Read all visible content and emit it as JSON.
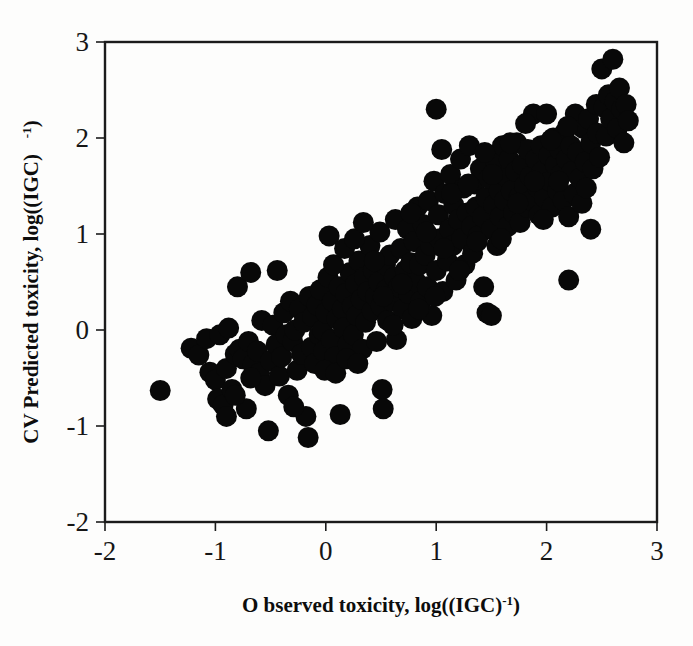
{
  "figure": {
    "name": "cv-predicted-vs-observed-toxicity-scatter",
    "background_color": "#fdfdfc",
    "marker_color": "#080808",
    "axis_color": "#1b1b1b"
  },
  "chart_data": {
    "type": "scatter",
    "title": "",
    "subtitle": "",
    "xlabel": "Observed toxicity, log((IGC)-1)",
    "xlabel_main": "O bserved toxicity, log((IGC)",
    "xlabel_sup": "-1",
    "xlabel_tail": ")",
    "ylabel": "CV Predicted toxicity, log((IGC)  -1)",
    "ylabel_main": "CV Predicted toxicity, log((IGC)",
    "ylabel_sup": "-1",
    "ylabel_tail": ")",
    "xlim": [
      -2,
      3
    ],
    "ylim": [
      -2,
      3
    ],
    "xticks": [
      -2,
      -1,
      0,
      1,
      2,
      3
    ],
    "yticks": [
      -2,
      -1,
      0,
      1,
      2,
      3
    ],
    "xtick_labels": [
      "-2",
      "-1",
      "0",
      "1",
      "2",
      "3"
    ],
    "ytick_labels": [
      "-2",
      "-1",
      "0",
      "1",
      "2",
      "3"
    ],
    "grid": false,
    "legend": false,
    "legend_position": "none",
    "marker_shape": "circle",
    "marker_diameter_px": 21,
    "n_points": 248,
    "series": [
      {
        "name": "compounds",
        "points": [
          [
            -1.5,
            -0.63
          ],
          [
            -1.22,
            -0.19
          ],
          [
            -1.15,
            -0.26
          ],
          [
            -1.08,
            -0.09
          ],
          [
            -1.05,
            -0.44
          ],
          [
            -1.0,
            -0.52
          ],
          [
            -0.98,
            -0.72
          ],
          [
            -0.96,
            -0.05
          ],
          [
            -0.93,
            -0.78
          ],
          [
            -0.9,
            -0.4
          ],
          [
            -0.88,
            0.02
          ],
          [
            -0.85,
            -0.62
          ],
          [
            -0.82,
            -0.25
          ],
          [
            -0.8,
            0.45
          ],
          [
            -0.78,
            -0.2
          ],
          [
            -0.75,
            -0.3
          ],
          [
            -0.72,
            -0.82
          ],
          [
            -0.7,
            -0.12
          ],
          [
            -0.68,
            0.6
          ],
          [
            -0.66,
            -0.36
          ],
          [
            -0.62,
            -0.22
          ],
          [
            -0.6,
            -0.45
          ],
          [
            -0.58,
            0.1
          ],
          [
            -0.55,
            -0.58
          ],
          [
            -0.52,
            -1.05
          ],
          [
            -0.5,
            -0.32
          ],
          [
            -0.48,
            0.05
          ],
          [
            -0.45,
            -0.15
          ],
          [
            -0.44,
            0.62
          ],
          [
            -0.42,
            -0.48
          ],
          [
            -0.4,
            -0.28
          ],
          [
            -0.38,
            0.18
          ],
          [
            -0.36,
            -0.05
          ],
          [
            -0.34,
            -0.68
          ],
          [
            -0.32,
            0.3
          ],
          [
            -0.3,
            -0.12
          ],
          [
            -0.28,
            0.0
          ],
          [
            -0.26,
            -0.42
          ],
          [
            -0.24,
            0.22
          ],
          [
            -0.22,
            -0.25
          ],
          [
            -0.2,
            0.08
          ],
          [
            -0.18,
            -0.9
          ],
          [
            -0.16,
            -1.12
          ],
          [
            -0.15,
            0.35
          ],
          [
            -0.13,
            -0.18
          ],
          [
            -0.12,
            0.14
          ],
          [
            -0.1,
            -0.35
          ],
          [
            -0.08,
            0.26
          ],
          [
            -0.06,
            -0.05
          ],
          [
            -0.05,
            0.42
          ],
          [
            -0.03,
            0.0
          ],
          [
            -0.02,
            -0.22
          ],
          [
            0.0,
            0.18
          ],
          [
            0.02,
            0.55
          ],
          [
            0.03,
            0.98
          ],
          [
            0.05,
            -0.1
          ],
          [
            0.06,
            0.3
          ],
          [
            0.08,
            -0.28
          ],
          [
            0.1,
            0.12
          ],
          [
            0.12,
            0.45
          ],
          [
            0.13,
            -0.88
          ],
          [
            0.15,
            0.22
          ],
          [
            0.16,
            0.02
          ],
          [
            0.18,
            0.38
          ],
          [
            0.2,
            -0.15
          ],
          [
            0.22,
            0.6
          ],
          [
            0.24,
            0.25
          ],
          [
            0.25,
            -0.05
          ],
          [
            0.27,
            0.48
          ],
          [
            0.28,
            0.15
          ],
          [
            0.3,
            0.72
          ],
          [
            0.32,
            0.32
          ],
          [
            0.33,
            -0.2
          ],
          [
            0.35,
            0.55
          ],
          [
            0.36,
            0.08
          ],
          [
            0.38,
            0.4
          ],
          [
            0.4,
            0.88
          ],
          [
            0.42,
            0.2
          ],
          [
            0.43,
            0.62
          ],
          [
            0.45,
            0.35
          ],
          [
            0.46,
            -0.12
          ],
          [
            0.48,
            0.5
          ],
          [
            0.49,
            1.02
          ],
          [
            0.5,
            0.25
          ],
          [
            0.51,
            -0.62
          ],
          [
            0.52,
            -0.82
          ],
          [
            0.54,
            0.68
          ],
          [
            0.55,
            0.42
          ],
          [
            0.56,
            0.1
          ],
          [
            0.58,
            0.78
          ],
          [
            0.6,
            0.3
          ],
          [
            0.62,
            0.55
          ],
          [
            0.63,
            1.15
          ],
          [
            0.64,
            -0.1
          ],
          [
            0.66,
            0.45
          ],
          [
            0.68,
            0.85
          ],
          [
            0.7,
            0.22
          ],
          [
            0.72,
            0.62
          ],
          [
            0.74,
            1.05
          ],
          [
            0.75,
            0.38
          ],
          [
            0.77,
            0.7
          ],
          [
            0.78,
            0.12
          ],
          [
            0.8,
            0.92
          ],
          [
            0.82,
            0.5
          ],
          [
            0.83,
            1.28
          ],
          [
            0.85,
            0.68
          ],
          [
            0.86,
            0.3
          ],
          [
            0.88,
            1.1
          ],
          [
            0.9,
            0.78
          ],
          [
            0.92,
            0.45
          ],
          [
            0.93,
            1.35
          ],
          [
            0.95,
            0.88
          ],
          [
            0.96,
            0.15
          ],
          [
            0.98,
            1.55
          ],
          [
            1.0,
            2.3
          ],
          [
            1.0,
            0.62
          ],
          [
            1.02,
            1.2
          ],
          [
            1.03,
            0.95
          ],
          [
            1.05,
            1.88
          ],
          [
            1.06,
            0.4
          ],
          [
            1.08,
            1.42
          ],
          [
            1.1,
            0.72
          ],
          [
            1.12,
            1.05
          ],
          [
            1.13,
            1.62
          ],
          [
            1.15,
            0.88
          ],
          [
            1.16,
            1.3
          ],
          [
            1.18,
            0.52
          ],
          [
            1.2,
            1.15
          ],
          [
            1.22,
            1.78
          ],
          [
            1.23,
            0.95
          ],
          [
            1.25,
            1.48
          ],
          [
            1.26,
            0.68
          ],
          [
            1.28,
            1.22
          ],
          [
            1.3,
            1.92
          ],
          [
            1.32,
            1.08
          ],
          [
            1.33,
            0.8
          ],
          [
            1.35,
            1.52
          ],
          [
            1.36,
            1.28
          ],
          [
            1.38,
            0.98
          ],
          [
            1.4,
            1.68
          ],
          [
            1.42,
            1.18
          ],
          [
            1.43,
            0.45
          ],
          [
            1.45,
            1.38
          ],
          [
            1.46,
            0.18
          ],
          [
            1.48,
            1.58
          ],
          [
            1.5,
            1.05
          ],
          [
            1.5,
            0.15
          ],
          [
            1.52,
            1.3
          ],
          [
            1.54,
            1.75
          ],
          [
            1.55,
            0.88
          ],
          [
            1.57,
            1.45
          ],
          [
            1.58,
            1.18
          ],
          [
            1.6,
            1.92
          ],
          [
            1.62,
            1.35
          ],
          [
            1.63,
            1.6
          ],
          [
            1.65,
            1.08
          ],
          [
            1.66,
            1.78
          ],
          [
            1.68,
            1.45
          ],
          [
            1.7,
            1.22
          ],
          [
            1.72,
            1.65
          ],
          [
            1.73,
            1.95
          ],
          [
            1.75,
            1.38
          ],
          [
            1.76,
            1.12
          ],
          [
            1.78,
            1.72
          ],
          [
            1.8,
            1.5
          ],
          [
            1.82,
            1.28
          ],
          [
            1.83,
            1.88
          ],
          [
            1.85,
            1.6
          ],
          [
            1.86,
            1.35
          ],
          [
            1.88,
            2.25
          ],
          [
            1.9,
            1.78
          ],
          [
            1.92,
            1.48
          ],
          [
            1.93,
            1.2
          ],
          [
            1.95,
            1.92
          ],
          [
            1.96,
            1.65
          ],
          [
            1.98,
            1.38
          ],
          [
            2.0,
            2.25
          ],
          [
            2.02,
            1.82
          ],
          [
            2.03,
            1.55
          ],
          [
            2.05,
            1.28
          ],
          [
            2.06,
            2.0
          ],
          [
            2.08,
            1.72
          ],
          [
            2.1,
            1.45
          ],
          [
            2.12,
            1.88
          ],
          [
            2.13,
            1.62
          ],
          [
            2.15,
            1.35
          ],
          [
            2.16,
            2.05
          ],
          [
            2.18,
            1.78
          ],
          [
            2.2,
            1.18
          ],
          [
            2.2,
            0.52
          ],
          [
            2.22,
            1.92
          ],
          [
            2.23,
            1.65
          ],
          [
            2.25,
            1.42
          ],
          [
            2.26,
            2.25
          ],
          [
            2.28,
            1.85
          ],
          [
            2.3,
            1.58
          ],
          [
            2.32,
            1.32
          ],
          [
            2.33,
            2.1
          ],
          [
            2.35,
            1.75
          ],
          [
            2.36,
            1.48
          ],
          [
            2.38,
            2.2
          ],
          [
            2.4,
            1.95
          ],
          [
            2.4,
            1.05
          ],
          [
            2.42,
            1.68
          ],
          [
            2.45,
            2.35
          ],
          [
            2.46,
            2.05
          ],
          [
            2.48,
            1.8
          ],
          [
            2.5,
            2.72
          ],
          [
            2.52,
            2.32
          ],
          [
            2.54,
            2.02
          ],
          [
            2.56,
            2.45
          ],
          [
            2.58,
            2.2
          ],
          [
            2.6,
            2.82
          ],
          [
            2.62,
            2.38
          ],
          [
            2.64,
            2.1
          ],
          [
            2.66,
            2.52
          ],
          [
            2.68,
            2.3
          ],
          [
            2.7,
            1.95
          ],
          [
            2.72,
            2.35
          ],
          [
            2.74,
            2.18
          ],
          [
            0.44,
            0.72
          ],
          [
            0.52,
            0.35
          ],
          [
            0.61,
            0.05
          ],
          [
            0.69,
            0.48
          ],
          [
            0.77,
            1.22
          ],
          [
            0.84,
            0.22
          ],
          [
            0.91,
            1.02
          ],
          [
            0.99,
            0.35
          ],
          [
            1.07,
            0.85
          ],
          [
            1.14,
            1.42
          ],
          [
            1.21,
            0.62
          ],
          [
            1.29,
            1.52
          ],
          [
            1.37,
            0.92
          ],
          [
            1.44,
            1.85
          ],
          [
            1.51,
            1.62
          ],
          [
            1.59,
            0.95
          ],
          [
            1.67,
            1.95
          ],
          [
            1.74,
            1.32
          ],
          [
            1.81,
            2.15
          ],
          [
            1.89,
            1.55
          ],
          [
            1.97,
            1.15
          ],
          [
            2.04,
            1.98
          ],
          [
            2.11,
            1.55
          ],
          [
            2.19,
            2.12
          ],
          [
            0.07,
            0.68
          ],
          [
            0.17,
            0.85
          ],
          [
            0.26,
            0.95
          ],
          [
            0.34,
            1.12
          ],
          [
            -0.01,
            -0.42
          ],
          [
            0.09,
            -0.45
          ],
          [
            0.19,
            -0.3
          ],
          [
            0.29,
            -0.35
          ],
          [
            -0.9,
            -0.9
          ],
          [
            -0.82,
            -0.68
          ],
          [
            -0.68,
            -0.5
          ],
          [
            -0.29,
            -0.8
          ]
        ]
      }
    ]
  }
}
